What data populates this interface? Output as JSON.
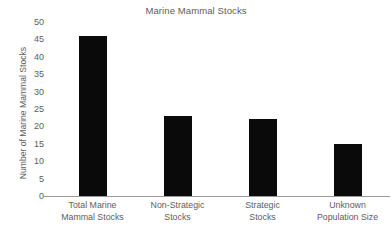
{
  "chart_data": {
    "type": "bar",
    "title": "Marine Mammal Stocks",
    "xlabel": "",
    "ylabel": "Number of Marine Mammal Stocks",
    "categories": [
      "Total Marine\nMammal Stocks",
      "Non-Strategic\nStocks",
      "Strategic\nStocks",
      "Unknown\nPopulation Size"
    ],
    "category_lines": [
      [
        "Total Marine",
        "Mammal Stocks"
      ],
      [
        "Non-Strategic",
        "Stocks"
      ],
      [
        "Strategic",
        "Stocks"
      ],
      [
        "Unknown",
        "Population Size"
      ]
    ],
    "values": [
      46,
      23,
      22,
      15
    ],
    "ylim": [
      0,
      50
    ],
    "yticks": [
      0,
      5,
      10,
      15,
      20,
      25,
      30,
      35,
      40,
      45,
      50
    ],
    "ytick_labels": [
      "0",
      "5",
      "10",
      "15",
      "20",
      "25",
      "30",
      "35",
      "40",
      "45",
      "50"
    ],
    "grid": false,
    "legend": "none",
    "bar_color": "#0a0a0a",
    "text_color": "#5d5d5d",
    "axis_color": "#9a9a9a",
    "background_color": "#ffffff"
  }
}
